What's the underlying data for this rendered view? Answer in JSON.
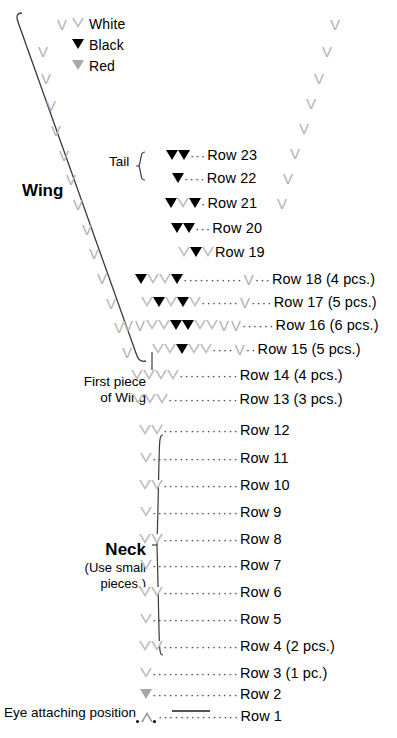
{
  "legend": {
    "items": [
      {
        "symbol": "white-triangle-icon",
        "label": "White"
      },
      {
        "symbol": "black-triangle-icon",
        "label": "Black"
      },
      {
        "symbol": "red-triangle-icon",
        "label": "Red"
      }
    ]
  },
  "labels": {
    "wing": "Wing",
    "tail": "Tail",
    "first_piece_line1": "First piece",
    "first_piece_line2": "of Wing",
    "neck": "Neck",
    "neck_note_line1": "(Use small",
    "neck_note_line2": "pieces.)",
    "eye_attaching": "Eye attaching position"
  },
  "colors": {
    "white_symbol": "#bdbdbd",
    "black_symbol": "#000000",
    "red_symbol": "#a8a8a8",
    "vee_symbol": "#b2b2b2",
    "text": "#000000",
    "line": "#333333",
    "background": "#ffffff"
  },
  "rows": [
    {
      "n": 23,
      "label": "Row 23",
      "symbols": [
        "black",
        "black"
      ],
      "dots": "···",
      "trailing_vee": false,
      "trailing_dots": ""
    },
    {
      "n": 22,
      "label": "Row 22",
      "symbols": [
        "black"
      ],
      "dots": "····",
      "trailing_vee": false,
      "trailing_dots": ""
    },
    {
      "n": 21,
      "label": "Row 21",
      "symbols": [
        "black",
        "white",
        "black"
      ],
      "dots": "·",
      "trailing_vee": false,
      "trailing_dots": ""
    },
    {
      "n": 20,
      "label": "Row 20",
      "symbols": [
        "black",
        "black"
      ],
      "dots": "···",
      "trailing_vee": false,
      "trailing_dots": ""
    },
    {
      "n": 19,
      "label": "Row 19",
      "symbols": [
        "white",
        "black",
        "white"
      ],
      "dots": "",
      "trailing_vee": false,
      "trailing_dots": ""
    },
    {
      "n": 18,
      "label": "Row 18 (4 pcs.)",
      "symbols": [
        "black",
        "white",
        "white",
        "black"
      ],
      "dots": "···········",
      "trailing_vee": true,
      "trailing_dots": "···"
    },
    {
      "n": 17,
      "label": "Row 17 (5 pcs.)",
      "symbols": [
        "white",
        "black",
        "white",
        "black",
        "white"
      ],
      "dots": "·······",
      "trailing_vee": true,
      "trailing_dots": "····"
    },
    {
      "n": 16,
      "label": "Row 16 (6 pcs.)",
      "symbols": [
        "vee",
        "vee",
        "white",
        "white",
        "black",
        "black",
        "white",
        "white",
        "vee",
        "vee"
      ],
      "dots": "······",
      "trailing_vee": false,
      "trailing_dots": ""
    },
    {
      "n": 15,
      "label": "Row 15 (5 pcs.)",
      "symbols": [
        "white",
        "white",
        "black",
        "white",
        "white"
      ],
      "dots": "····",
      "trailing_vee": true,
      "trailing_dots": "··"
    },
    {
      "n": 14,
      "label": "Row 14 (4 pcs.)",
      "symbols": [
        "white",
        "white",
        "white",
        "white"
      ],
      "dots": "···········",
      "trailing_vee": false,
      "trailing_dots": ""
    },
    {
      "n": 13,
      "label": "Row 13 (3 pcs.)",
      "symbols": [
        "white",
        "white",
        "white"
      ],
      "dots": "·············",
      "trailing_vee": false,
      "trailing_dots": ""
    },
    {
      "n": 12,
      "label": "Row 12",
      "symbols": [
        "white",
        "white"
      ],
      "dots": "··············",
      "trailing_vee": false,
      "trailing_dots": ""
    },
    {
      "n": 11,
      "label": "Row 11",
      "symbols": [
        "white"
      ],
      "dots": "················",
      "trailing_vee": false,
      "trailing_dots": ""
    },
    {
      "n": 10,
      "label": "Row 10",
      "symbols": [
        "white",
        "white"
      ],
      "dots": "··············",
      "trailing_vee": false,
      "trailing_dots": ""
    },
    {
      "n": 9,
      "label": "Row  9",
      "symbols": [
        "white"
      ],
      "dots": "················",
      "trailing_vee": false,
      "trailing_dots": ""
    },
    {
      "n": 8,
      "label": "Row  8",
      "symbols": [
        "white",
        "white"
      ],
      "dots": "··············",
      "trailing_vee": false,
      "trailing_dots": ""
    },
    {
      "n": 7,
      "label": "Row  7",
      "symbols": [
        "white"
      ],
      "dots": "················",
      "trailing_vee": false,
      "trailing_dots": ""
    },
    {
      "n": 6,
      "label": "Row  6",
      "symbols": [
        "white",
        "white"
      ],
      "dots": "··············",
      "trailing_vee": false,
      "trailing_dots": ""
    },
    {
      "n": 5,
      "label": "Row  5",
      "symbols": [
        "white"
      ],
      "dots": "················",
      "trailing_vee": false,
      "trailing_dots": ""
    },
    {
      "n": 4,
      "label": "Row  4 (2 pcs.)",
      "symbols": [
        "white",
        "white"
      ],
      "dots": "··············",
      "trailing_vee": false,
      "trailing_dots": ""
    },
    {
      "n": 3,
      "label": "Row  3 (1 pc.)",
      "symbols": [
        "white"
      ],
      "dots": "················",
      "trailing_vee": false,
      "trailing_dots": ""
    },
    {
      "n": 2,
      "label": "Row  2",
      "symbols": [
        "red"
      ],
      "dots": "················",
      "trailing_vee": false,
      "trailing_dots": ""
    },
    {
      "n": 1,
      "label": "Row  1",
      "symbols": [
        "dot",
        "up",
        "dot"
      ],
      "dots": "···············",
      "trailing_vee": false,
      "trailing_dots": ""
    }
  ],
  "left_vees": [
    {
      "x": 57,
      "y": 17
    },
    {
      "x": 38,
      "y": 44
    },
    {
      "x": 41,
      "y": 71
    },
    {
      "x": 46,
      "y": 98
    },
    {
      "x": 51,
      "y": 123
    },
    {
      "x": 59,
      "y": 148
    },
    {
      "x": 66,
      "y": 172
    },
    {
      "x": 73,
      "y": 197
    },
    {
      "x": 82,
      "y": 222
    },
    {
      "x": 89,
      "y": 246
    },
    {
      "x": 97,
      "y": 271
    },
    {
      "x": 106,
      "y": 296
    },
    {
      "x": 114,
      "y": 320
    },
    {
      "x": 122,
      "y": 345
    }
  ],
  "right_vees": [
    {
      "x": 330,
      "y": 17
    },
    {
      "x": 322,
      "y": 44
    },
    {
      "x": 314,
      "y": 71
    },
    {
      "x": 306,
      "y": 96
    },
    {
      "x": 299,
      "y": 121
    },
    {
      "x": 290,
      "y": 146
    },
    {
      "x": 283,
      "y": 171
    },
    {
      "x": 277,
      "y": 196
    }
  ]
}
